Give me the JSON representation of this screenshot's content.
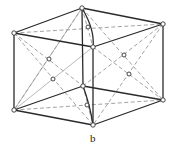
{
  "figure": {
    "label": "b",
    "colors": {
      "edge": "#2a2a2a",
      "dashed": "#8a8a8a",
      "atom_fill": "#ffffff"
    }
  }
}
